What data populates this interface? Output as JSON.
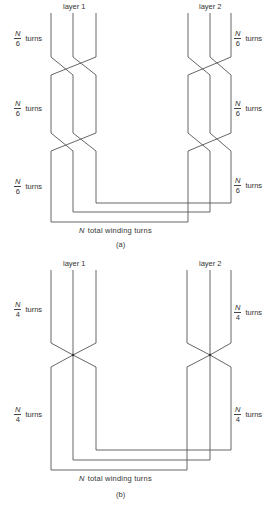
{
  "figure_a": {
    "layer1_label": "layer 1",
    "layer2_label": "layer 2",
    "section_labels_left": [
      {
        "numerator": "N",
        "denominator": "6",
        "suffix": "turns"
      },
      {
        "numerator": "N",
        "denominator": "6",
        "suffix": "turns"
      },
      {
        "numerator": "N",
        "denominator": "6",
        "suffix": "turns"
      }
    ],
    "section_labels_right": [
      {
        "numerator": "N",
        "denominator": "6",
        "suffix": "turns"
      },
      {
        "numerator": "N",
        "denominator": "6",
        "suffix": "turns"
      },
      {
        "numerator": "N",
        "denominator": "6",
        "suffix": "turns"
      }
    ],
    "total_symbol": "N",
    "total_label": "total winding turns",
    "caption": "(a)"
  },
  "figure_b": {
    "layer1_label": "layer 1",
    "layer2_label": "layer 2",
    "section_labels_left": [
      {
        "numerator": "N",
        "denominator": "4",
        "suffix": "turns"
      },
      {
        "numerator": "N",
        "denominator": "4",
        "suffix": "turns"
      }
    ],
    "section_labels_right": [
      {
        "numerator": "N",
        "denominator": "4",
        "suffix": "turns"
      },
      {
        "numerator": "N",
        "denominator": "4",
        "suffix": "turns"
      }
    ],
    "total_symbol": "N",
    "total_label": "total winding turns",
    "caption": "(b)"
  }
}
